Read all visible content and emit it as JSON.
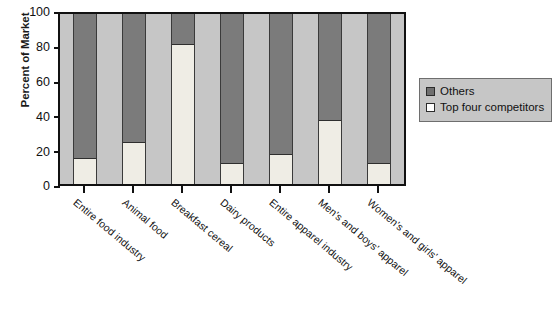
{
  "chart_data": {
    "type": "bar",
    "subtype": "stacked-bar-100",
    "title": "",
    "xlabel": "",
    "ylabel": "Percent of Market",
    "ylim": [
      0,
      100
    ],
    "yticks": [
      0,
      20,
      40,
      60,
      80,
      100
    ],
    "grid": false,
    "legend_position": "right",
    "categories": [
      "Entire food industry",
      "Animal food",
      "Breakfast cereal",
      "Dairy products",
      "Entire apparel industry",
      "Men's and boys' apparel",
      "Women's and girls' apparel"
    ],
    "series": [
      {
        "name": "Top four competitors",
        "color": "#efede5",
        "values": [
          15,
          24,
          82,
          12,
          17,
          37,
          12
        ]
      },
      {
        "name": "Others",
        "color": "#7b7b7b",
        "values": [
          85,
          76,
          18,
          88,
          83,
          63,
          88
        ]
      }
    ]
  },
  "axis": {
    "y_title": "Percent of Market",
    "y_tick_labels": [
      "100",
      "80",
      "60",
      "40",
      "20",
      "0"
    ]
  },
  "legend": {
    "items": [
      {
        "label": "Others",
        "swatch": "dark-gray-swatch"
      },
      {
        "label": "Top four competitors",
        "swatch": "white-swatch"
      }
    ]
  },
  "colors": {
    "plot_background": "#c6c6c6",
    "others": "#7b7b7b",
    "top_four": "#efede5",
    "axis": "#111111",
    "page_background": "#ffffff"
  }
}
